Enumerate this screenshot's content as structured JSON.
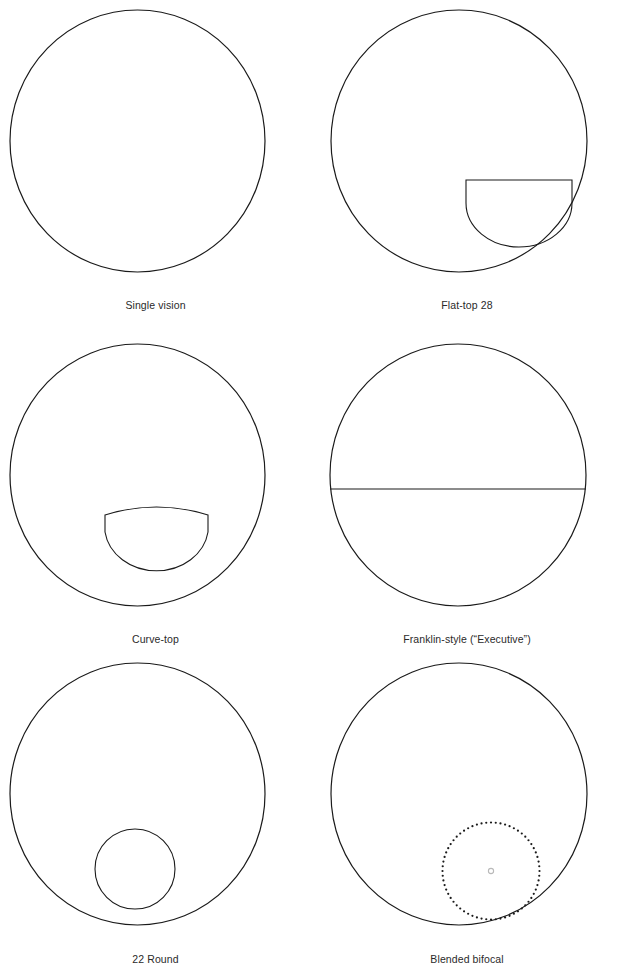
{
  "figure": {
    "background_color": "#ffffff",
    "stroke_color": "#1a1a1a",
    "marker_color": "#b9b9b9",
    "columns": 2,
    "rows": 3,
    "panels": [
      {
        "caption": "Single vision",
        "segment_type": "none",
        "lens": {
          "cx": 137.5,
          "cy": 141,
          "rx": 127.5,
          "ry": 131
        }
      },
      {
        "caption": "Flat-top 28",
        "segment_type": "flat-top",
        "lens": {
          "cx": 148,
          "cy": 141,
          "rx": 128,
          "ry": 131
        },
        "segment": {
          "left": 155,
          "right": 261,
          "top": 180,
          "bottom": 245
        }
      },
      {
        "caption": "Curve-top",
        "segment_type": "curve-top",
        "lens": {
          "cx": 137.5,
          "cy": 148,
          "rx": 127.5,
          "ry": 131
        },
        "segment": {
          "left": 105,
          "right": 208,
          "top": 182,
          "bottom": 248,
          "arch": 6
        }
      },
      {
        "caption": "Franklin-style (“Executive”)",
        "segment_type": "franklin-line",
        "lens": {
          "cx": 147,
          "cy": 148,
          "rx": 128,
          "ry": 131
        },
        "segment": {
          "y": 162
        }
      },
      {
        "caption": "22 Round",
        "segment_type": "round-22",
        "lens": {
          "cx": 137.5,
          "cy": 140,
          "rx": 127.5,
          "ry": 131
        },
        "segment": {
          "cx": 135,
          "cy": 215,
          "r": 40
        }
      },
      {
        "caption": "Blended bifocal",
        "segment_type": "blended-dotted",
        "lens": {
          "cx": 148,
          "cy": 140,
          "rx": 128,
          "ry": 131
        },
        "segment": {
          "cx": 180,
          "cy": 217,
          "r": 48.5,
          "dot_count": 64,
          "dot_radius": 1.1,
          "center_marker_radius": 2.6
        }
      }
    ]
  }
}
